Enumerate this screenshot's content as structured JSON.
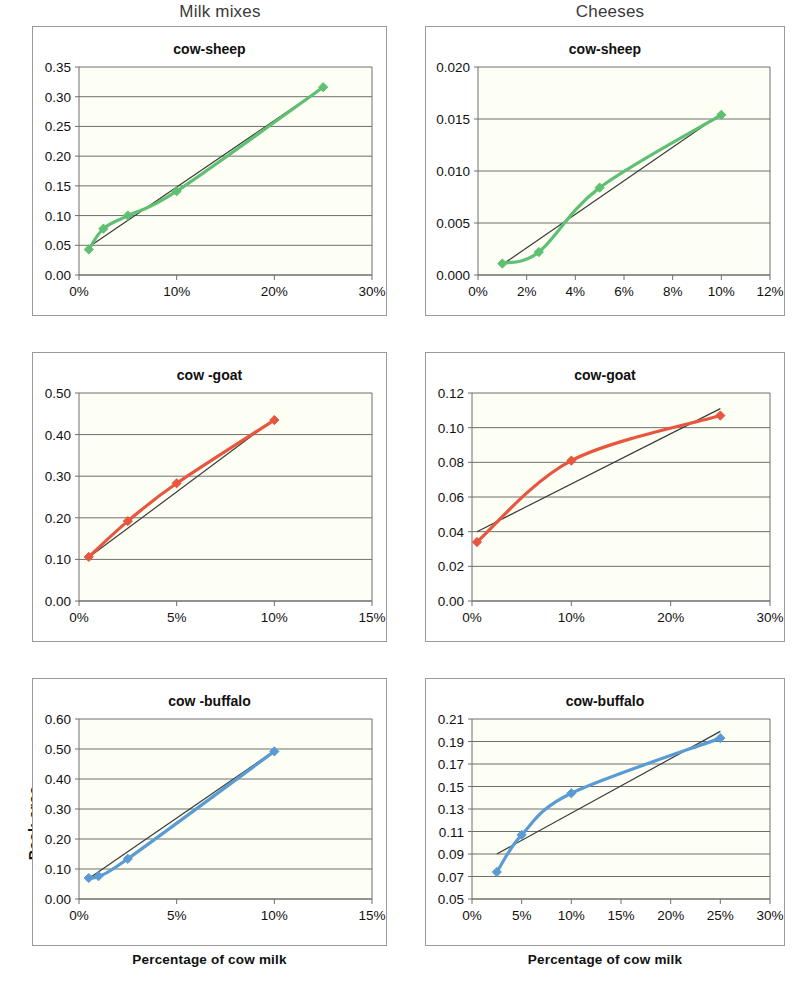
{
  "figure": {
    "columns": [
      {
        "id": "milk-mixes",
        "label": "Milk mixes"
      },
      {
        "id": "cheeses",
        "label": "Cheeses"
      }
    ],
    "y_axis_title": "Peak  area",
    "x_axis_title": "Percentage  of cow milk",
    "colors": {
      "sheep_series": "#5fbf72",
      "goat_series": "#e8563f",
      "buffalo_series": "#5a9bd4",
      "trendline": "#3a3a3a",
      "gridline": "#6e6e6e",
      "axis": "#6e6e6e",
      "plot_background": "#fefff4",
      "panel_border": "#9a9a9a"
    }
  },
  "chart_data": [
    {
      "id": "milk-cow-sheep",
      "type": "line",
      "title": "cow-sheep",
      "column": "Milk mixes",
      "xlabel": "",
      "ylabel": "Peak  area",
      "xlim": [
        0,
        30
      ],
      "ylim": [
        0.0,
        0.35
      ],
      "xticks": [
        0,
        10,
        20,
        30
      ],
      "xticklabels": [
        "0%",
        "10%",
        "20%",
        "30%"
      ],
      "yticks": [
        0.0,
        0.05,
        0.1,
        0.15,
        0.2,
        0.25,
        0.3,
        0.35
      ],
      "yticklabels": [
        "0.00",
        "0.05",
        "0.10",
        "0.15",
        "0.20",
        "0.25",
        "0.30",
        "0.35"
      ],
      "grid": true,
      "series": [
        {
          "name": "cow-sheep",
          "color": "#5fbf72",
          "x": [
            1,
            2.5,
            5,
            10,
            25
          ],
          "y": [
            0.043,
            0.078,
            0.1,
            0.141,
            0.316
          ],
          "marker": "diamond"
        }
      ],
      "trendline": {
        "x": [
          1,
          25
        ],
        "y": [
          0.047,
          0.316
        ],
        "color": "#3a3a3a"
      }
    },
    {
      "id": "cheese-cow-sheep",
      "type": "line",
      "title": "cow-sheep",
      "column": "Cheeses",
      "xlabel": "",
      "ylabel": "",
      "xlim": [
        0,
        12
      ],
      "ylim": [
        0.0,
        0.02
      ],
      "xticks": [
        0,
        2,
        4,
        6,
        8,
        10,
        12
      ],
      "xticklabels": [
        "0%",
        "2%",
        "4%",
        "6%",
        "8%",
        "10%",
        "12%"
      ],
      "yticks": [
        0.0,
        0.005,
        0.01,
        0.015,
        0.02
      ],
      "yticklabels": [
        "0.000",
        "0.005",
        "0.010",
        "0.015",
        "0.020"
      ],
      "grid": true,
      "series": [
        {
          "name": "cow-sheep",
          "color": "#5fbf72",
          "x": [
            1,
            2.5,
            5,
            10
          ],
          "y": [
            0.0011,
            0.0022,
            0.0084,
            0.0154
          ],
          "marker": "diamond"
        }
      ],
      "trendline": {
        "x": [
          1,
          10
        ],
        "y": [
          0.001,
          0.0155
        ],
        "color": "#3a3a3a"
      }
    },
    {
      "id": "milk-cow-goat",
      "type": "line",
      "title": "cow -goat",
      "column": "Milk mixes",
      "xlabel": "",
      "ylabel": "Peak  area",
      "xlim": [
        0,
        15
      ],
      "ylim": [
        0.0,
        0.5
      ],
      "xticks": [
        0,
        5,
        10,
        15
      ],
      "xticklabels": [
        "0%",
        "5%",
        "10%",
        "15%"
      ],
      "yticks": [
        0.0,
        0.1,
        0.2,
        0.3,
        0.4,
        0.5
      ],
      "yticklabels": [
        "0.00",
        "0.10",
        "0.20",
        "0.30",
        "0.40",
        "0.50"
      ],
      "grid": true,
      "series": [
        {
          "name": "cow-goat",
          "color": "#e8563f",
          "x": [
            0.5,
            2.5,
            5,
            10
          ],
          "y": [
            0.106,
            0.192,
            0.283,
            0.435
          ],
          "marker": "diamond"
        }
      ],
      "trendline": {
        "x": [
          0.5,
          10
        ],
        "y": [
          0.105,
          0.437
        ],
        "color": "#3a3a3a"
      }
    },
    {
      "id": "cheese-cow-goat",
      "type": "line",
      "title": "cow-goat",
      "column": "Cheeses",
      "xlabel": "",
      "ylabel": "",
      "xlim": [
        0,
        30
      ],
      "ylim": [
        0.0,
        0.12
      ],
      "xticks": [
        0,
        10,
        20,
        30
      ],
      "xticklabels": [
        "0%",
        "10%",
        "20%",
        "30%"
      ],
      "yticks": [
        0.0,
        0.02,
        0.04,
        0.06,
        0.08,
        0.1,
        0.12
      ],
      "yticklabels": [
        "0.00",
        "0.02",
        "0.04",
        "0.06",
        "0.08",
        "0.10",
        "0.12"
      ],
      "grid": true,
      "series": [
        {
          "name": "cow-goat",
          "color": "#e8563f",
          "x": [
            0.5,
            10,
            25
          ],
          "y": [
            0.034,
            0.081,
            0.107
          ],
          "marker": "diamond"
        }
      ],
      "trendline": {
        "x": [
          0.5,
          25
        ],
        "y": [
          0.04,
          0.111
        ],
        "color": "#3a3a3a"
      }
    },
    {
      "id": "milk-cow-buffalo",
      "type": "line",
      "title": "cow -buffalo",
      "column": "Milk mixes",
      "xlabel": "Percentage  of cow milk",
      "ylabel": "Peak  area",
      "xlim": [
        0,
        15
      ],
      "ylim": [
        0.0,
        0.6
      ],
      "xticks": [
        0,
        5,
        10,
        15
      ],
      "xticklabels": [
        "0%",
        "5%",
        "10%",
        "15%"
      ],
      "yticks": [
        0.0,
        0.1,
        0.2,
        0.3,
        0.4,
        0.5,
        0.6
      ],
      "yticklabels": [
        "0.00",
        "0.10",
        "0.20",
        "0.30",
        "0.40",
        "0.50",
        "0.60"
      ],
      "grid": true,
      "series": [
        {
          "name": "cow-buffalo",
          "color": "#5a9bd4",
          "x": [
            0.5,
            1,
            2.5,
            10
          ],
          "y": [
            0.07,
            0.076,
            0.134,
            0.492
          ],
          "marker": "diamond"
        }
      ],
      "trendline": {
        "x": [
          0.5,
          10
        ],
        "y": [
          0.068,
          0.494
        ],
        "color": "#3a3a3a"
      }
    },
    {
      "id": "cheese-cow-buffalo",
      "type": "line",
      "title": "cow-buffalo",
      "column": "Cheeses",
      "xlabel": "Percentage  of cow milk",
      "ylabel": "",
      "xlim": [
        0,
        30
      ],
      "ylim": [
        0.05,
        0.21
      ],
      "xticks": [
        0,
        5,
        10,
        15,
        20,
        25,
        30
      ],
      "xticklabels": [
        "0%",
        "5%",
        "10%",
        "15%",
        "20%",
        "25%",
        "30%"
      ],
      "yticks": [
        0.05,
        0.07,
        0.09,
        0.11,
        0.13,
        0.15,
        0.17,
        0.19,
        0.21
      ],
      "yticklabels": [
        "0.05",
        "0.07",
        "0.09",
        "0.11",
        "0.13",
        "0.15",
        "0.17",
        "0.19",
        "0.21"
      ],
      "grid": true,
      "series": [
        {
          "name": "cow-buffalo",
          "color": "#5a9bd4",
          "x": [
            2.5,
            5,
            10,
            25
          ],
          "y": [
            0.074,
            0.107,
            0.144,
            0.193
          ],
          "marker": "diamond"
        }
      ],
      "trendline": {
        "x": [
          2.5,
          25
        ],
        "y": [
          0.09,
          0.199
        ],
        "color": "#3a3a3a"
      }
    }
  ]
}
